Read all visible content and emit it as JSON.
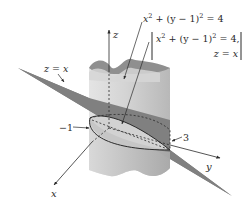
{
  "figure": {
    "type": "3d-surface-intersection",
    "colors": {
      "background": "#ffffff",
      "plane": "#7c7c7c",
      "cylinder_light": "#d9d9d9",
      "cylinder_mid": "#c4c4c4",
      "cylinder_top_inner": "#8f8f8f",
      "ellipse_fill": "#cfcfcf",
      "line": "#2a2a2a"
    }
  },
  "axes": {
    "z": {
      "label": "z"
    },
    "y": {
      "label": "y"
    },
    "x": {
      "label": "x"
    }
  },
  "labels": {
    "cylinder_eq": {
      "x2": "x",
      "exp1": "2",
      "mid": " + (y − 1)",
      "exp2": "2",
      "rhs": " = 4"
    },
    "intersection_eq": {
      "line1_x": "x",
      "line1_exp1": "2",
      "line1_mid": " + (y − 1)",
      "line1_exp2": "2",
      "line1_rhs": " = 4,",
      "line2": "z = x"
    },
    "plane_eq": "z = x",
    "tick_neg1": "−1",
    "tick_3": "3"
  }
}
